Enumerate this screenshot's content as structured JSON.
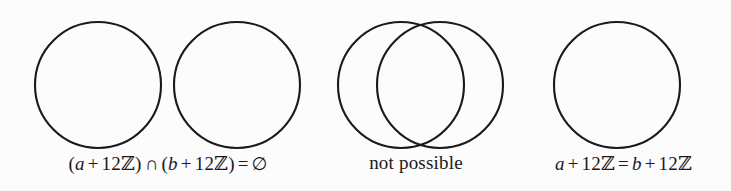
{
  "figure": {
    "background_color": "#fcfcfc",
    "stroke_color": "#1a1a1a",
    "text_color": "#1a1a1a"
  },
  "panels": [
    {
      "id": "disjoint",
      "name": "disjoint-cosets",
      "circles": [
        {
          "cx": 98,
          "cy": 85,
          "r": 63
        },
        {
          "cx": 237,
          "cy": 85,
          "r": 63
        }
      ],
      "caption": {
        "full": "(a + 12ℤ) ∩ (b + 12ℤ) = ∅",
        "parts": {
          "open1": "(",
          "a": "a",
          "plus1": "+",
          "num1": "12",
          "z1": "ℤ",
          "close1": ")",
          "intersect": "∩",
          "open2": "(",
          "b": "b",
          "plus2": "+",
          "num2": "12",
          "z2": "ℤ",
          "close2": ")",
          "equals": "=",
          "emptyset": "∅"
        }
      }
    },
    {
      "id": "overlap",
      "name": "overlapping-cosets",
      "circles": [
        {
          "cx": 83,
          "cy": 85,
          "r": 63
        },
        {
          "cx": 122,
          "cy": 85,
          "r": 63
        }
      ],
      "caption": {
        "full": "not possible",
        "parts": {
          "text": "not possible"
        }
      }
    },
    {
      "id": "equal",
      "name": "equal-cosets",
      "circles": [
        {
          "cx": 101,
          "cy": 85,
          "r": 63
        }
      ],
      "caption": {
        "full": "a + 12ℤ = b + 12ℤ",
        "parts": {
          "a": "a",
          "plus1": "+",
          "num1": "12",
          "z1": "ℤ",
          "equals": "=",
          "b": "b",
          "plus2": "+",
          "num2": "12",
          "z2": "ℤ"
        }
      }
    }
  ]
}
